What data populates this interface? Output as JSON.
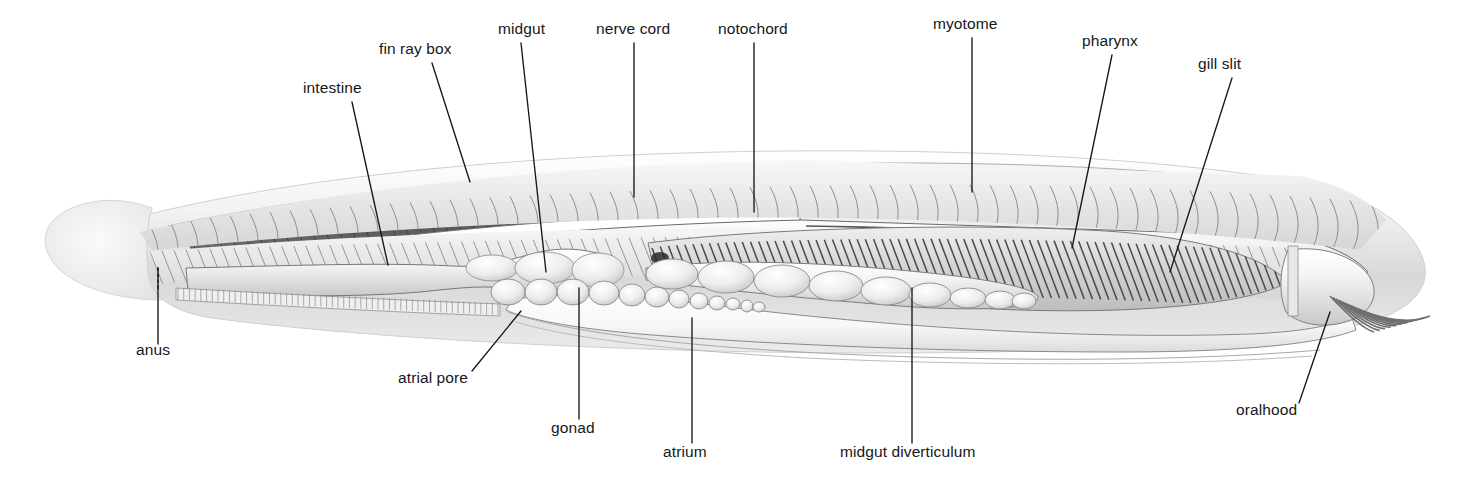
{
  "figure": {
    "orientation": "lateral cutaway, head to the right, tail to the left",
    "background_color": "#ffffff",
    "ink_color": "#15171a",
    "label_font_size_px": 15.5
  },
  "labels": [
    {
      "id": "intestine",
      "text": "intestine",
      "x": 303,
      "y": 92,
      "anchor": "start",
      "leader": [
        [
          352,
          102
        ],
        [
          388,
          265
        ]
      ]
    },
    {
      "id": "fin-ray-box",
      "text": "fin ray box",
      "x": 379,
      "y": 53,
      "anchor": "start",
      "leader": [
        [
          432,
          63
        ],
        [
          470,
          182
        ]
      ]
    },
    {
      "id": "midgut",
      "text": "midgut",
      "x": 498,
      "y": 33,
      "anchor": "start",
      "leader": [
        [
          521,
          43
        ],
        [
          546,
          272
        ]
      ]
    },
    {
      "id": "nerve-cord",
      "text": "nerve cord",
      "x": 596,
      "y": 33,
      "anchor": "start",
      "leader": [
        [
          634,
          43
        ],
        [
          634,
          197
        ]
      ]
    },
    {
      "id": "notochord",
      "text": "notochord",
      "x": 718,
      "y": 33,
      "anchor": "start",
      "leader": [
        [
          754,
          43
        ],
        [
          754,
          212
        ]
      ]
    },
    {
      "id": "myotome",
      "text": "myotome",
      "x": 933,
      "y": 28,
      "anchor": "start",
      "leader": [
        [
          972,
          38
        ],
        [
          972,
          192
        ]
      ]
    },
    {
      "id": "pharynx",
      "text": "pharynx",
      "x": 1082,
      "y": 45,
      "anchor": "start",
      "leader": [
        [
          1112,
          55
        ],
        [
          1072,
          248
        ]
      ]
    },
    {
      "id": "gill-slit",
      "text": "gill slit",
      "x": 1198,
      "y": 68,
      "anchor": "start",
      "leader": [
        [
          1232,
          78
        ],
        [
          1170,
          272
        ]
      ]
    },
    {
      "id": "anus",
      "text": "anus",
      "x": 136,
      "y": 354,
      "anchor": "start",
      "leader": [
        [
          158,
          344
        ],
        [
          158,
          268
        ]
      ],
      "leader_dotted_tail": [
        [
          158,
          268
        ],
        [
          158,
          290
        ]
      ]
    },
    {
      "id": "atrial-pore",
      "text": "atrial pore",
      "x": 398,
      "y": 382,
      "anchor": "start",
      "leader": [
        [
          472,
          371
        ],
        [
          521,
          311
        ]
      ]
    },
    {
      "id": "gonad",
      "text": "gonad",
      "x": 551,
      "y": 432,
      "anchor": "start",
      "leader": [
        [
          579,
          419
        ],
        [
          579,
          288
        ]
      ]
    },
    {
      "id": "atrium",
      "text": "atrium",
      "x": 663,
      "y": 456,
      "anchor": "start",
      "leader": [
        [
          692,
          443
        ],
        [
          692,
          318
        ]
      ]
    },
    {
      "id": "midgut-diverticulum",
      "text": "midgut diverticulum",
      "x": 840,
      "y": 456,
      "anchor": "start",
      "leader": [
        [
          912,
          443
        ],
        [
          912,
          288
        ]
      ]
    },
    {
      "id": "oralhood",
      "text": "oralhood",
      "x": 1236,
      "y": 414,
      "anchor": "start",
      "leader": [
        [
          1299,
          403
        ],
        [
          1330,
          312
        ]
      ]
    }
  ]
}
